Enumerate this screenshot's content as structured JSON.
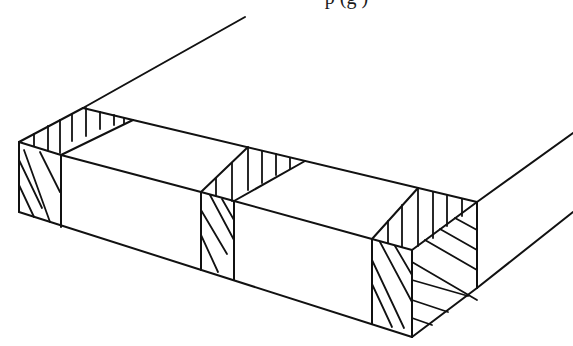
{
  "caption": {
    "partial_text": "p (g )"
  },
  "figure": {
    "stroke_color": "#111111",
    "background": "#ffffff",
    "outline_edges": [
      [
        19,
        142,
        19,
        212
      ],
      [
        19,
        142,
        83,
        108
      ],
      [
        83,
        108,
        245,
        17
      ],
      [
        83,
        108,
        133,
        120
      ],
      [
        133,
        120,
        477,
        202
      ],
      [
        19,
        142,
        61,
        155
      ],
      [
        61,
        155,
        133,
        120
      ],
      [
        61,
        155,
        61,
        227
      ],
      [
        61,
        155,
        201,
        192
      ],
      [
        19,
        212,
        412,
        337
      ],
      [
        201,
        192,
        248,
        147
      ],
      [
        201,
        192,
        201,
        270
      ],
      [
        201,
        192,
        234,
        201
      ],
      [
        234,
        201,
        305,
        161
      ],
      [
        234,
        201,
        234,
        280
      ],
      [
        234,
        201,
        372,
        239
      ],
      [
        372,
        239,
        418,
        188
      ],
      [
        372,
        239,
        372,
        324
      ],
      [
        372,
        239,
        412,
        250
      ],
      [
        412,
        250,
        412,
        337
      ],
      [
        412,
        250,
        477,
        202
      ],
      [
        477,
        202,
        477,
        288
      ],
      [
        412,
        337,
        477,
        288
      ],
      [
        477,
        202,
        573,
        133
      ],
      [
        477,
        288,
        573,
        212
      ]
    ],
    "hatch_lines": [
      [
        34,
        134,
        34,
        146
      ],
      [
        48,
        126,
        48,
        150
      ],
      [
        60,
        120,
        60,
        153
      ],
      [
        72,
        114,
        72,
        141
      ],
      [
        86,
        108,
        86,
        136
      ],
      [
        100,
        112,
        100,
        129
      ],
      [
        114,
        115,
        114,
        125
      ],
      [
        124,
        118,
        124,
        124
      ],
      [
        19,
        160,
        42,
        208
      ],
      [
        19,
        185,
        34,
        217
      ],
      [
        24,
        150,
        50,
        222
      ],
      [
        40,
        152,
        60,
        192
      ],
      [
        216,
        178,
        216,
        196
      ],
      [
        232,
        163,
        232,
        201
      ],
      [
        248,
        148,
        248,
        190
      ],
      [
        262,
        151,
        262,
        183
      ],
      [
        276,
        154,
        276,
        175
      ],
      [
        290,
        158,
        290,
        169
      ],
      [
        201,
        210,
        227,
        254
      ],
      [
        201,
        235,
        218,
        272
      ],
      [
        210,
        195,
        234,
        240
      ],
      [
        222,
        199,
        234,
        220
      ],
      [
        388,
        221,
        388,
        243
      ],
      [
        402,
        205,
        402,
        247
      ],
      [
        418,
        188,
        418,
        246
      ],
      [
        433,
        192,
        433,
        238
      ],
      [
        447,
        195,
        447,
        226
      ],
      [
        462,
        199,
        462,
        216
      ],
      [
        372,
        260,
        404,
        328
      ],
      [
        372,
        284,
        392,
        327
      ],
      [
        380,
        242,
        412,
        302
      ],
      [
        395,
        246,
        412,
        275
      ],
      [
        412,
        262,
        477,
        300
      ],
      [
        412,
        280,
        468,
        296
      ],
      [
        412,
        300,
        448,
        312
      ],
      [
        425,
        240,
        477,
        270
      ],
      [
        440,
        229,
        477,
        250
      ],
      [
        455,
        218,
        477,
        230
      ],
      [
        412,
        318,
        432,
        325
      ]
    ]
  }
}
